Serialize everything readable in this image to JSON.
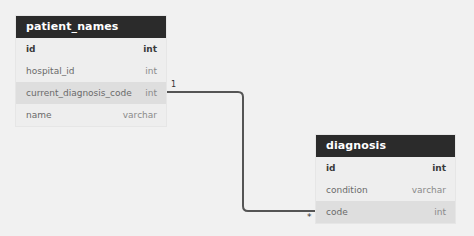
{
  "diagram": {
    "type": "er-diagram",
    "tables": [
      {
        "name": "patient_names",
        "columns": [
          {
            "name": "id",
            "type": "int",
            "primary_key": true
          },
          {
            "name": "hospital_id",
            "type": "int"
          },
          {
            "name": "current_diagnosis_code",
            "type": "int",
            "highlighted": true
          },
          {
            "name": "name",
            "type": "varchar"
          }
        ]
      },
      {
        "name": "diagnosis",
        "columns": [
          {
            "name": "id",
            "type": "int",
            "primary_key": true
          },
          {
            "name": "condition",
            "type": "varchar"
          },
          {
            "name": "code",
            "type": "int",
            "highlighted": true
          }
        ]
      }
    ],
    "relationships": [
      {
        "from": "patient_names.current_diagnosis_code",
        "to": "diagnosis.code",
        "from_cardinality": "1",
        "to_cardinality": "*"
      }
    ],
    "colors": {
      "header_bg": "#2b2b2b",
      "header_text": "#ffffff",
      "row_bg": "#eeeeee",
      "row_highlight_bg": "#dedede",
      "line": "#555555",
      "canvas_bg": "#f1f1f1"
    }
  }
}
